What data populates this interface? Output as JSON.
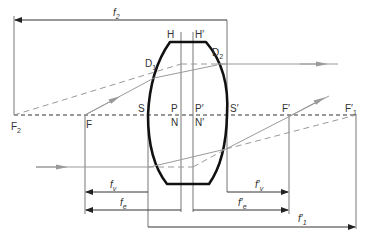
{
  "diagram": {
    "colors": {
      "lens": "#111111",
      "lines": "#666666",
      "rays": "#999999",
      "axis": "#333333",
      "text": "#333333"
    },
    "points": {
      "F2": {
        "main": "F",
        "sub": "2"
      },
      "F": {
        "main": "F"
      },
      "S": {
        "main": "S"
      },
      "P": {
        "main": "P"
      },
      "N": {
        "main": "N"
      },
      "P_prime": {
        "main": "P′"
      },
      "N_prime": {
        "main": "N′"
      },
      "S_prime": {
        "main": "S′"
      },
      "F_prime": {
        "main": "F′"
      },
      "F_prime_1": {
        "main": "F′",
        "sub": "1"
      },
      "H": {
        "main": "H"
      },
      "H_prime": {
        "main": "H′"
      },
      "D1": {
        "main": "D",
        "sub": "1"
      },
      "D2": {
        "main": "D",
        "sub": "2"
      }
    },
    "distances": {
      "f2": {
        "main": "f",
        "sub": "2"
      },
      "fv": {
        "main": "f",
        "sub": "v"
      },
      "fe": {
        "main": "f",
        "sub": "e"
      },
      "fv_prime": {
        "main": "f′",
        "sub": "v"
      },
      "fe_prime": {
        "main": "f′",
        "sub": "e"
      },
      "f1_prime": {
        "main": "f′",
        "sub": "1"
      }
    }
  }
}
